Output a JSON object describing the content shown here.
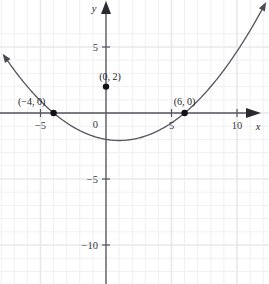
{
  "chart_data": {
    "type": "line",
    "title": "",
    "subtitle": "",
    "xlabel": "x",
    "ylabel": "y",
    "xlim": [
      -8,
      12.5
    ],
    "ylim": [
      -13,
      6.5
    ],
    "grid": true,
    "legend_position": "none",
    "curve": {
      "name": "parabola",
      "equation": "y = -(1/12)(x + 4)(x - 6)",
      "orientation": "opens-downward",
      "vertex": [
        1,
        2.083
      ],
      "x_intercepts": [
        -4,
        6
      ],
      "y_intercept": 2,
      "x_start": -7.5,
      "x_end": 11.9,
      "color": "#5a5a62",
      "arrow_start": true,
      "arrow_end": true
    },
    "points": [
      {
        "label": "(−4, 0)",
        "x": -4,
        "y": 0,
        "label_dx": -22,
        "label_dy": -8
      },
      {
        "label": "(0, 2)",
        "x": 0,
        "y": 2,
        "label_dx": 4,
        "label_dy": -7
      },
      {
        "label": "(6, 0)",
        "x": 6,
        "y": 0,
        "label_dx": 0,
        "label_dy": -8
      }
    ],
    "x_ticks": [
      {
        "value": -5,
        "label": "−5"
      },
      {
        "value": 5,
        "label": "5"
      },
      {
        "value": 10,
        "label": "10"
      }
    ],
    "y_ticks": [
      {
        "value": 5,
        "label": "5"
      },
      {
        "value": -5,
        "label": "−5"
      },
      {
        "value": -10,
        "label": "−10"
      }
    ],
    "origin_label": "0",
    "grid_minor_step": 1,
    "grid_major_step": 5,
    "axis_colors": {
      "axis": "#55555c",
      "curve": "#5a5a62",
      "point": "#111116",
      "grid_minor": "#f0f0f2",
      "grid_major": "#e8e8ec",
      "background": "#ffffff"
    }
  }
}
